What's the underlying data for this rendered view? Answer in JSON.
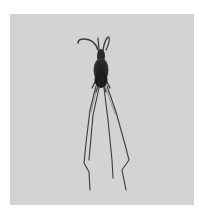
{
  "image": {
    "subject": "copepod-like plankton organism with long legs",
    "background_color": "#d3d3d3",
    "frame_color": "#ffffff",
    "organism_color": "#1e1e1e"
  }
}
